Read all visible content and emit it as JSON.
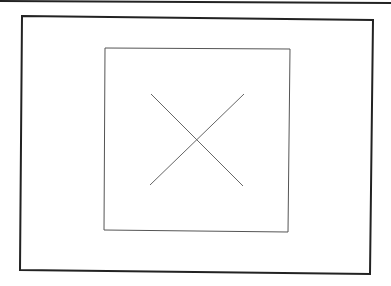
{
  "diagram": {
    "background": "#ffffff",
    "top_line": {
      "x1": 0,
      "y1": 1,
      "x2": 391,
      "y2": 3,
      "color": "#222222",
      "width": 2
    },
    "outer_frame": {
      "points": "22,16 373,20 370,274 20,270",
      "color": "#222222",
      "width": 2
    },
    "inner_frame": {
      "points": "105,48 290,49 288,232 104,230",
      "color": "#555555",
      "width": 1
    },
    "cross": {
      "line_a": {
        "x1": 151,
        "y1": 94,
        "x2": 243,
        "y2": 186
      },
      "line_b": {
        "x1": 244,
        "y1": 94,
        "x2": 150,
        "y2": 185
      },
      "color": "#666666",
      "width": 1
    }
  }
}
